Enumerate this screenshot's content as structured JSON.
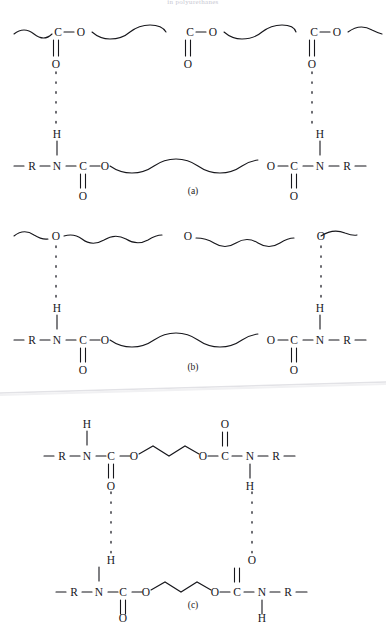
{
  "figure": {
    "top_caption": "in polyurethanes",
    "atoms": {
      "C": "C",
      "O": "O",
      "N": "N",
      "H": "H",
      "R": "R"
    },
    "panels": [
      {
        "id": "a",
        "caption": "(a)",
        "description": "Hydrogen bonding between urethane N-H and polyester carbonyl C=O",
        "top_chain": {
          "type": "polyester",
          "repeat_labels": [
            "C",
            "O",
            "C",
            "O",
            "C",
            "O"
          ],
          "carbonyl_labels": [
            "O",
            "O",
            "O"
          ],
          "carbonyl_x": [
            56,
            188,
            312
          ]
        },
        "bottom_chain": {
          "type": "urethane-polyether",
          "labels": [
            "R",
            "N",
            "C",
            "O",
            "O",
            "C",
            "N",
            "R"
          ],
          "nh_labels": [
            "H",
            "H"
          ],
          "carbonyl_labels": [
            "O",
            "O"
          ]
        },
        "hbonds": [
          {
            "donor": "H",
            "acceptor": "O",
            "x": 56
          },
          {
            "donor": "H",
            "acceptor": "O",
            "x": 312
          }
        ]
      },
      {
        "id": "b",
        "caption": "(b)",
        "description": "Hydrogen bonding between urethane N-H and polyether ether oxygen",
        "top_chain": {
          "type": "polyether",
          "repeat_labels": [
            "O",
            "O",
            "O"
          ],
          "ether_x": [
            56,
            188,
            312
          ]
        },
        "bottom_chain": {
          "type": "urethane-polyether",
          "labels": [
            "R",
            "N",
            "C",
            "O",
            "O",
            "C",
            "N",
            "R"
          ],
          "nh_labels": [
            "H",
            "H"
          ],
          "carbonyl_labels": [
            "O",
            "O"
          ]
        },
        "hbonds": [
          {
            "donor": "H",
            "acceptor": "O",
            "x": 56
          },
          {
            "donor": "H",
            "acceptor": "O",
            "x": 312
          }
        ]
      },
      {
        "id": "c",
        "caption": "(c)",
        "description": "Hydrogen bonding between urethane N-H and urethane carbonyl C=O of adjacent hard segment",
        "top_chain": {
          "type": "urethane-butanediol",
          "labels": [
            "R",
            "N",
            "C",
            "O",
            "O",
            "C",
            "N",
            "R"
          ],
          "nh_labels": [
            "H",
            "H"
          ],
          "carbonyl_labels": [
            "O",
            "O"
          ]
        },
        "bottom_chain": {
          "type": "urethane-butanediol",
          "labels": [
            "R",
            "N",
            "C",
            "O",
            "O",
            "C",
            "N",
            "R"
          ],
          "nh_labels": [
            "H",
            "H"
          ],
          "carbonyl_labels": [
            "O",
            "O"
          ]
        },
        "hbonds": [
          {
            "donor": "O",
            "acceptor": "H",
            "x": 110
          },
          {
            "donor": "H",
            "acceptor": "O",
            "x": 256
          }
        ]
      }
    ]
  }
}
